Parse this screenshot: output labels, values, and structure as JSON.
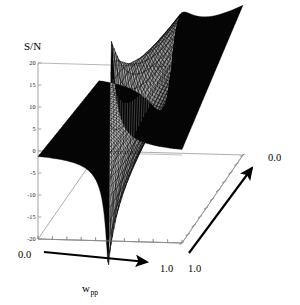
{
  "figure": {
    "kind": "3d-surface-plot",
    "background": "#ffffff",
    "surface_color": "#050505",
    "axis_color": "#8a8a8a",
    "arrow_color": "#000000"
  },
  "zaxis": {
    "name": "S/N",
    "label": "S/N",
    "ticks": [
      20,
      15,
      10,
      5,
      0,
      -5,
      -10,
      -15,
      -20
    ],
    "tick_labels": [
      "20",
      "15",
      "10",
      "5",
      "0",
      "-5",
      "-10",
      "-15",
      "-20"
    ],
    "min": -20,
    "max": 20
  },
  "xaxis": {
    "label": "w",
    "subscript": "pp",
    "start_label": "0.0",
    "end_label": "1.0",
    "min": 0.0,
    "max": 1.0,
    "ticks": 10,
    "arrow": "right"
  },
  "yaxis": {
    "near_label": "1.0",
    "far_label": "0.0",
    "min": 0.0,
    "max": 1.0,
    "ticks": 10,
    "arrow": "up-right"
  },
  "chart_data": {
    "type": "surface",
    "title": "",
    "xlabel": "w_pp",
    "ylabel": "",
    "zlabel": "S/N",
    "xlim": [
      0.0,
      1.0
    ],
    "ylim": [
      0.0,
      1.0
    ],
    "zlim": [
      -20,
      20
    ],
    "grid": false,
    "legend": null,
    "x_ticks": [
      0.0,
      1.0
    ],
    "y_ticks": [
      1.0,
      0.0
    ],
    "z_ticks": [
      -20,
      -15,
      -10,
      -5,
      0,
      5,
      10,
      15,
      20
    ],
    "singularity_x": 0.5,
    "peak_value": 20,
    "trough_value": -20,
    "edge_value_left": -3,
    "edge_value_right": 14,
    "nx": 61,
    "ny": 41,
    "surface_formula": "S/N(x,y) = A(y) * (x-0.5) / ((x-0.5)^2 + g(y)^2)",
    "gamma_near": 0.012,
    "gamma_far": 0.075,
    "amplitude_near": 0.62,
    "amplitude_far": 1.55,
    "grid_samples": [
      {
        "y": 0.0,
        "x": [
          0.0,
          0.15,
          0.3,
          0.42,
          0.47,
          0.5,
          0.53,
          0.58,
          0.7,
          0.85,
          1.0
        ],
        "z": [
          -3.0,
          -4.0,
          -6.5,
          -13.0,
          -19.5,
          0.0,
          19.5,
          13.0,
          7.0,
          4.5,
          3.2
        ]
      },
      {
        "y": 0.5,
        "x": [
          0.0,
          0.15,
          0.3,
          0.42,
          0.47,
          0.5,
          0.53,
          0.58,
          0.7,
          0.85,
          1.0
        ],
        "z": [
          -2.6,
          -3.4,
          -5.6,
          -11.0,
          -17.0,
          0.0,
          17.0,
          11.5,
          7.4,
          6.0,
          5.4
        ]
      },
      {
        "y": 1.0,
        "x": [
          0.0,
          0.15,
          0.3,
          0.42,
          0.47,
          0.5,
          0.53,
          0.58,
          0.7,
          0.85,
          1.0
        ],
        "z": [
          -2.2,
          -2.9,
          -4.6,
          -8.5,
          -13.0,
          0.0,
          20.0,
          18.0,
          16.0,
          14.8,
          14.0
        ]
      }
    ]
  },
  "projection": {
    "origin_x": 38,
    "origin_y": 151,
    "z_top_y": 63,
    "z_bottom_y": 239,
    "x_axis_dx": 144,
    "x_axis_dy": 4,
    "y_axis_dx": 61,
    "y_axis_dy": -88
  }
}
